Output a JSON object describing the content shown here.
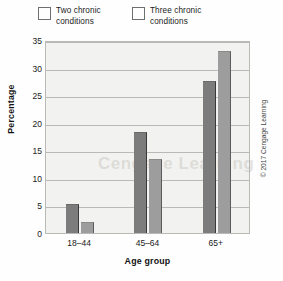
{
  "chart_data": {
    "type": "bar",
    "title": "",
    "categories": [
      "18–44",
      "45–64",
      "65+"
    ],
    "series": [
      {
        "name": "Two chronic conditions",
        "color": "#7c7c7c",
        "values": [
          5.3,
          18.3,
          27.6
        ]
      },
      {
        "name": "Three chronic conditions",
        "color": "#9d9d9d",
        "values": [
          2.0,
          13.4,
          33.0
        ]
      }
    ],
    "xlabel": "Age group",
    "ylabel": "Percentage",
    "ylim": [
      0,
      35
    ],
    "yticks": [
      0,
      5,
      10,
      15,
      20,
      25,
      30,
      35
    ],
    "ytick_labels": [
      "0",
      "5",
      "10",
      "15",
      "20",
      "25",
      "30",
      "35"
    ],
    "grid": true,
    "legend_position": "top-left"
  },
  "legend": {
    "entries": [
      {
        "label": "Two chronic conditions"
      },
      {
        "label": "Three chronic conditions"
      }
    ]
  },
  "credit": {
    "text": "© 2017 Cengage Learning"
  },
  "watermark": {
    "text": "Cengage Learning"
  }
}
